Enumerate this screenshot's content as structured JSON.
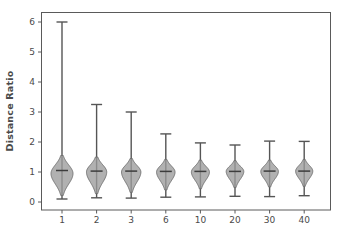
{
  "chart_data": {
    "type": "violin",
    "title": "",
    "xlabel": "",
    "ylabel": "Distance Ratio",
    "xtick_labels": [
      "1",
      "2",
      "3",
      "6",
      "10",
      "20",
      "30",
      "40"
    ],
    "ytick_labels": [
      "0",
      "1",
      "2",
      "3",
      "4",
      "5",
      "6"
    ],
    "ytick_values": [
      0,
      1,
      2,
      3,
      4,
      5,
      6
    ],
    "ylim": [
      -0.25,
      6.45
    ],
    "grid": false,
    "legend": false,
    "categories": [
      "1",
      "2",
      "3",
      "6",
      "10",
      "20",
      "30",
      "40"
    ],
    "series": [
      {
        "name": "Distance Ratio distribution",
        "violins": [
          {
            "category": "1",
            "median": 1.05,
            "whisker_low": 0.1,
            "whisker_high": 6.0,
            "body_low": 0.22,
            "body_high": 1.55,
            "max_width": 1.0,
            "mode": 0.95
          },
          {
            "category": "2",
            "median": 1.03,
            "whisker_low": 0.14,
            "whisker_high": 3.25,
            "body_low": 0.28,
            "body_high": 1.5,
            "max_width": 0.92,
            "mode": 1.0
          },
          {
            "category": "3",
            "median": 1.03,
            "whisker_low": 0.13,
            "whisker_high": 3.0,
            "body_low": 0.32,
            "body_high": 1.45,
            "max_width": 0.88,
            "mode": 1.0
          },
          {
            "category": "6",
            "median": 1.02,
            "whisker_low": 0.16,
            "whisker_high": 2.27,
            "body_low": 0.4,
            "body_high": 1.42,
            "max_width": 0.84,
            "mode": 1.0
          },
          {
            "category": "10",
            "median": 1.02,
            "whisker_low": 0.17,
            "whisker_high": 1.97,
            "body_low": 0.44,
            "body_high": 1.4,
            "max_width": 0.82,
            "mode": 1.0
          },
          {
            "category": "20",
            "median": 1.02,
            "whisker_low": 0.19,
            "whisker_high": 1.9,
            "body_low": 0.48,
            "body_high": 1.38,
            "max_width": 0.8,
            "mode": 1.02
          },
          {
            "category": "30",
            "median": 1.03,
            "whisker_low": 0.18,
            "whisker_high": 2.03,
            "body_low": 0.5,
            "body_high": 1.4,
            "max_width": 0.8,
            "mode": 1.02
          },
          {
            "category": "40",
            "median": 1.03,
            "whisker_low": 0.21,
            "whisker_high": 2.02,
            "body_low": 0.52,
            "body_high": 1.42,
            "max_width": 0.78,
            "mode": 1.03
          }
        ]
      }
    ],
    "colors": {
      "violin_fill": "#9b9b9b",
      "violin_edge": "#6e6e6e",
      "whisker": "#555555",
      "median": "#3d3d3d",
      "axis": "#5a5a5a",
      "text": "#4a4a4a",
      "background": "#ffffff"
    }
  }
}
